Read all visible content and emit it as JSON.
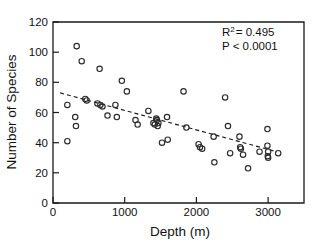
{
  "chart_data": {
    "type": "scatter",
    "title": "",
    "xlabel": "Depth (m)",
    "ylabel": "Number of Species",
    "xlim": [
      0,
      3500
    ],
    "ylim": [
      0,
      120
    ],
    "xticks": [
      0,
      1000,
      2000,
      3000
    ],
    "yticks": [
      0,
      20,
      40,
      60,
      80,
      100,
      120
    ],
    "xtick_labels": [
      "0",
      "1000",
      "2000",
      "3000"
    ],
    "ytick_labels": [
      "0",
      "20",
      "40",
      "60",
      "80",
      "100",
      "120"
    ],
    "grid": false,
    "legend": false,
    "marker": "open-circle",
    "points": [
      {
        "x": 200,
        "y": 65
      },
      {
        "x": 200,
        "y": 41
      },
      {
        "x": 330,
        "y": 104
      },
      {
        "x": 310,
        "y": 57
      },
      {
        "x": 320,
        "y": 51
      },
      {
        "x": 400,
        "y": 94
      },
      {
        "x": 450,
        "y": 69
      },
      {
        "x": 470,
        "y": 68
      },
      {
        "x": 620,
        "y": 66
      },
      {
        "x": 650,
        "y": 89
      },
      {
        "x": 660,
        "y": 65
      },
      {
        "x": 690,
        "y": 64
      },
      {
        "x": 760,
        "y": 58
      },
      {
        "x": 870,
        "y": 65
      },
      {
        "x": 890,
        "y": 57
      },
      {
        "x": 960,
        "y": 81
      },
      {
        "x": 1030,
        "y": 74
      },
      {
        "x": 1150,
        "y": 55
      },
      {
        "x": 1180,
        "y": 52
      },
      {
        "x": 1330,
        "y": 61
      },
      {
        "x": 1400,
        "y": 53
      },
      {
        "x": 1420,
        "y": 52
      },
      {
        "x": 1440,
        "y": 56
      },
      {
        "x": 1450,
        "y": 55
      },
      {
        "x": 1460,
        "y": 51
      },
      {
        "x": 1470,
        "y": 53
      },
      {
        "x": 1520,
        "y": 40
      },
      {
        "x": 1590,
        "y": 57
      },
      {
        "x": 1600,
        "y": 42
      },
      {
        "x": 1820,
        "y": 74
      },
      {
        "x": 1860,
        "y": 50
      },
      {
        "x": 2030,
        "y": 39
      },
      {
        "x": 2050,
        "y": 37
      },
      {
        "x": 2080,
        "y": 36
      },
      {
        "x": 2240,
        "y": 44
      },
      {
        "x": 2250,
        "y": 27
      },
      {
        "x": 2400,
        "y": 70
      },
      {
        "x": 2440,
        "y": 51
      },
      {
        "x": 2470,
        "y": 33
      },
      {
        "x": 2600,
        "y": 44
      },
      {
        "x": 2610,
        "y": 37
      },
      {
        "x": 2620,
        "y": 36
      },
      {
        "x": 2650,
        "y": 32
      },
      {
        "x": 2720,
        "y": 23
      },
      {
        "x": 2880,
        "y": 34
      },
      {
        "x": 2990,
        "y": 49
      },
      {
        "x": 2990,
        "y": 38
      },
      {
        "x": 2995,
        "y": 31
      },
      {
        "x": 3000,
        "y": 34
      },
      {
        "x": 3000,
        "y": 30
      },
      {
        "x": 3140,
        "y": 33
      }
    ],
    "fit_line": {
      "style": "dashed",
      "x_start": 100,
      "y_start": 73,
      "x_end": 3120,
      "y_end": 34
    },
    "annotations": {
      "r_squared_prefix": "R",
      "r_squared_exponent": "2",
      "r_squared_value": "= 0.495",
      "p_value": "P < 0.0001"
    }
  }
}
